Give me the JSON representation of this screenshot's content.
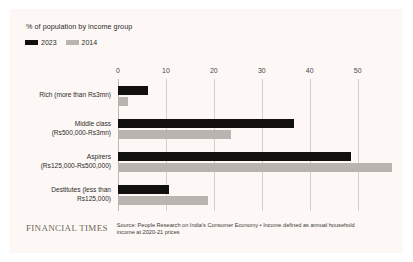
{
  "chart_data": {
    "type": "bar",
    "orientation": "horizontal",
    "title": "% of population by income group",
    "xlabel": "",
    "ylabel": "",
    "xlim": [
      0,
      58
    ],
    "xticks": [
      0,
      10,
      20,
      30,
      40,
      50
    ],
    "xtick_labels": [
      "0",
      "10",
      "20",
      "30",
      "40",
      "50"
    ],
    "grid": true,
    "legend_position": "top-left",
    "categories": [
      "Rich (more than Rs3mn)",
      "Middle class\n(Rs500,000-Rs3mn)",
      "Aspirers\n(Rs125,000-Rs500,000)",
      "Destitutes (less than\nRs125,000)"
    ],
    "category_lines": [
      [
        "Rich (more than Rs3mn)"
      ],
      [
        "Middle class",
        "(Rs500,000-Rs3mn)"
      ],
      [
        "Aspirers",
        "(Rs125,000-Rs500,000)"
      ],
      [
        "Destitutes (less than",
        "Rs125,000)"
      ]
    ],
    "series": [
      {
        "name": "2023",
        "color": "#12100e",
        "values": [
          6.2,
          36.8,
          48.7,
          10.6
        ]
      },
      {
        "name": "2014",
        "color": "#b9b4b0",
        "values": [
          2.1,
          23.6,
          57.2,
          18.7
        ]
      }
    ]
  },
  "legend": {
    "items": [
      {
        "label": "2023",
        "color": "#12100e"
      },
      {
        "label": "2014",
        "color": "#b9b4b0"
      }
    ]
  },
  "footer": {
    "masthead": "FINANCIAL TIMES",
    "source": "Source: People Research on India's Consumer Economy • Income defined as annual household income at 2020-21 prices"
  },
  "colors": {
    "background": "#fdf8f5",
    "grid": "#d9cfca",
    "axis": "#c2b6b0",
    "text": "#2b2b28",
    "series_2023": "#12100e",
    "series_2014": "#b9b4b0"
  }
}
